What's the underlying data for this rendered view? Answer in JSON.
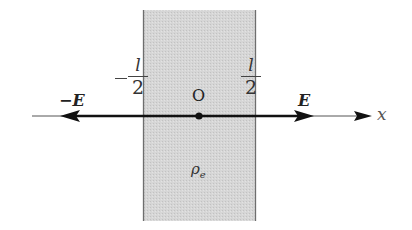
{
  "diagram": {
    "slab": {
      "left_boundary_label": {
        "sign": "−",
        "numerator": "l",
        "denominator": "2"
      },
      "right_boundary_label": {
        "numerator": "l",
        "denominator": "2"
      },
      "charge_density_label": "ρ",
      "charge_density_subscript": "e",
      "fill_color": "#d4d4d4",
      "edge_color": "#777777"
    },
    "axis": {
      "label": "x",
      "origin_label": "O"
    },
    "field_vectors": {
      "left_label": "−E",
      "right_label": "E"
    }
  }
}
